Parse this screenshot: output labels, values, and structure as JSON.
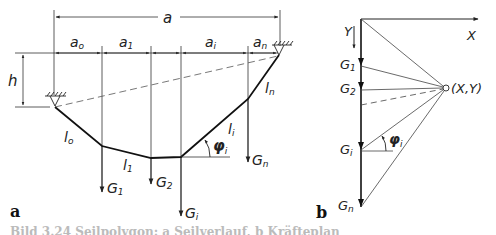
{
  "figure": {
    "panel_a": {
      "label": "a",
      "dimensions": {
        "span": "a",
        "height": "h",
        "a0": "a",
        "a0_sub": "o",
        "a1": "a",
        "a1_sub": "1",
        "ai": "a",
        "ai_sub": "i",
        "an": "a",
        "an_sub": "n"
      },
      "segments": {
        "l0": "l",
        "l0_sub": "o",
        "l1": "l",
        "l1_sub": "1",
        "li": "l",
        "li_sub": "i",
        "ln": "l",
        "ln_sub": "n"
      },
      "loads": {
        "G1": "G",
        "G1_sub": "1",
        "G2": "G",
        "G2_sub": "2",
        "Gi": "G",
        "Gi_sub": "i",
        "Gn": "G",
        "Gn_sub": "n"
      },
      "angle": "φ",
      "angle_sub": "i"
    },
    "panel_b": {
      "label": "b",
      "axis_x": "X",
      "axis_y": "Y",
      "pole": "(X,Y)",
      "loads": {
        "G1": "G",
        "G1_sub": "1",
        "G2": "G",
        "G2_sub": "2",
        "Gi": "G",
        "Gi_sub": "i",
        "Gn": "G",
        "Gn_sub": "n"
      },
      "angle": "φ",
      "angle_sub": "i"
    },
    "caption": "Bild 3.24  Seilpolygon: a Seilverlauf, b Kräfteplan"
  },
  "colors": {
    "line": "#222222",
    "thin": "#444444",
    "dashed": "#555555",
    "caption": "#bbbbbb"
  }
}
